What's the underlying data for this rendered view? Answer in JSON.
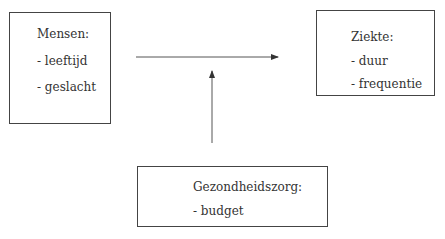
{
  "diagram": {
    "nodes": [
      {
        "id": "mensen",
        "title": "Mensen:",
        "items": [
          "- leeftijd",
          "- geslacht"
        ]
      },
      {
        "id": "ziekte",
        "title": "Ziekte:",
        "items": [
          "- duur",
          "- frequentie"
        ]
      },
      {
        "id": "gezondheidszorg",
        "title": "Gezondheidszorg:",
        "items": [
          "- budget"
        ]
      }
    ],
    "edges": [
      {
        "from": "mensen",
        "to": "ziekte",
        "type": "arrow"
      },
      {
        "from": "gezondheidszorg",
        "to": "mensen-ziekte-edge",
        "type": "arrow"
      }
    ]
  }
}
